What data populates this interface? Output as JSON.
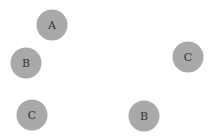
{
  "nodes": [
    {
      "label": "A",
      "x": 52,
      "y": 25
    },
    {
      "label": "B",
      "x": 26,
      "y": 63
    },
    {
      "label": "C",
      "x": 32,
      "y": 115
    },
    {
      "label": "C",
      "x": 188,
      "y": 57
    },
    {
      "label": "B",
      "x": 144,
      "y": 116
    }
  ],
  "colors": {
    "node_fill": "#a9a9a9",
    "label": "#333333",
    "background": "#ffffff"
  }
}
